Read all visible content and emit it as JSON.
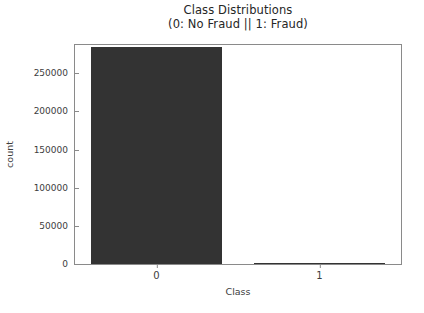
{
  "chart_data": {
    "type": "bar",
    "title": "Class Distributions",
    "subtitle": "(0: No Fraud || 1: Fraud)",
    "categories": [
      "0",
      "1"
    ],
    "values": [
      284315,
      492
    ],
    "xlabel": "Class",
    "ylabel": "count",
    "ylim": [
      0,
      287000
    ],
    "xlim": [
      -0.5,
      1.5
    ],
    "yticks": [
      0,
      50000,
      100000,
      150000,
      200000,
      250000
    ],
    "ytick_labels": [
      "0",
      "50000",
      "100000",
      "150000",
      "200000",
      "250000"
    ],
    "xtick_labels": [
      "0",
      "1"
    ],
    "grid": false,
    "legend": null,
    "bar_color": "#333333",
    "background_color": "#ffffff",
    "spine_color": "#8a8a8a",
    "bar_width_fraction": 0.8
  }
}
